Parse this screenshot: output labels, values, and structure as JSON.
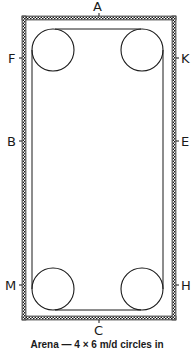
{
  "diagram": {
    "type": "dressage-arena",
    "markers": {
      "top": "A",
      "bottom": "C",
      "left_upper": "F",
      "left_middle": "B",
      "left_lower": "M",
      "right_upper": "K",
      "right_middle": "E",
      "right_lower": "H"
    },
    "circles": [
      "top-left",
      "top-right",
      "bottom-left",
      "bottom-right"
    ],
    "caption": "Arena — 4 × 6 m/d circles in"
  },
  "colors": {
    "line": "#1a1a1a",
    "background": "#ffffff"
  }
}
